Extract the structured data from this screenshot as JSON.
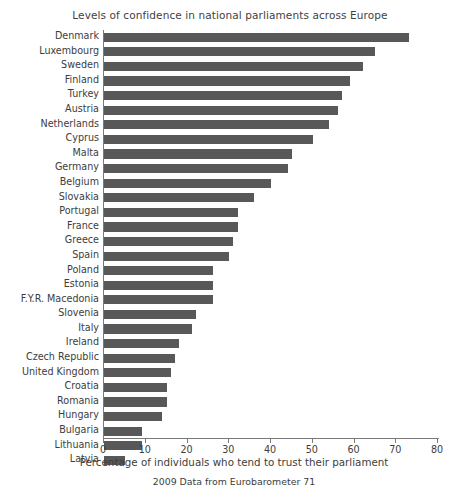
{
  "chart_data": {
    "type": "bar",
    "orientation": "horizontal",
    "title": "Levels of confidence in national parliaments across Europe",
    "subtitle": "2009 Data from Eurobarometer 71",
    "xlabel": "Percentage of individuals who tend to trust their parliament",
    "ylabel": "",
    "xlim": [
      0,
      80
    ],
    "xticks": [
      0,
      10,
      20,
      30,
      40,
      50,
      60,
      70,
      80
    ],
    "grid": false,
    "legend": null,
    "bar_color": "#585858",
    "axis_color": "#7a7a7a",
    "categories": [
      "Denmark",
      "Luxembourg",
      "Sweden",
      "Finland",
      "Turkey",
      "Austria",
      "Netherlands",
      "Cyprus",
      "Malta",
      "Germany",
      "Belgium",
      "Slovakia",
      "Portugal",
      "France",
      "Greece",
      "Spain",
      "Poland",
      "Estonia",
      "F.Y.R. Macedonia",
      "Slovenia",
      "Italy",
      "Ireland",
      "Czech Republic",
      "United Kingdom",
      "Croatia",
      "Romania",
      "Hungary",
      "Bulgaria",
      "Lithuania",
      "Latvia"
    ],
    "values": [
      73,
      65,
      62,
      59,
      57,
      56,
      54,
      50,
      45,
      44,
      40,
      36,
      32,
      32,
      31,
      30,
      26,
      26,
      26,
      22,
      21,
      18,
      17,
      16,
      15,
      15,
      14,
      9,
      9,
      5
    ]
  }
}
